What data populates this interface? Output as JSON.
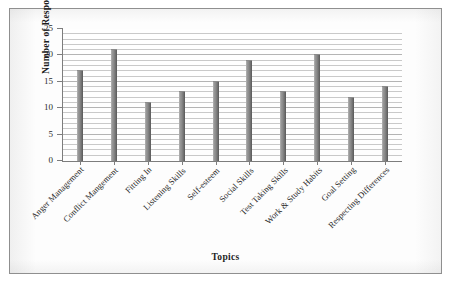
{
  "chart_data": {
    "type": "bar",
    "title": "",
    "xlabel": "Topics",
    "ylabel": "Number of Responses",
    "categories": [
      "Anger Management",
      "Conflict Mangement",
      "Fitting In",
      "Listening Skills",
      "Self-esteem",
      "Social Skills",
      "Test Taking Skills",
      "Work & Study Habits",
      "Goal Setting",
      "Respecting Differences"
    ],
    "values": [
      17,
      21,
      11,
      13,
      15,
      19,
      13,
      20,
      12,
      14
    ],
    "ylim": [
      0,
      25
    ],
    "ytick_labels": [
      "0",
      "5",
      "10",
      "15",
      "20",
      "25"
    ],
    "ytick_values": [
      0,
      5,
      10,
      15,
      20,
      25
    ],
    "y_major_step": 5,
    "y_minor_step": 1,
    "grid": true,
    "grid_orientation": "horizontal",
    "legend": false,
    "legend_position": "none",
    "bar_color": "#8b8b8b",
    "bar_color_dark": "#585858",
    "bar_color_light": "#b9b9b9",
    "axis_color": "#7d7d7d",
    "gridline_color": "#c9c9c9",
    "frame_color": "#8f8f8f",
    "background_color": "#fdfdfd",
    "xlabel_rotation": -45
  }
}
